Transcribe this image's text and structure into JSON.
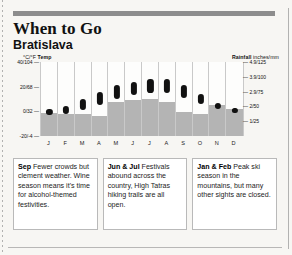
{
  "header": {
    "title": "When to Go",
    "subtitle": "Bratislava"
  },
  "chart_legend": {
    "temp_label": "°C/°F",
    "temp_word": "Temp",
    "rain_word": "Rainfall",
    "rain_label": "inches/mm"
  },
  "chart_data": {
    "type": "bar",
    "subtitle": "Bratislava",
    "categories": [
      "J",
      "F",
      "M",
      "A",
      "M",
      "J",
      "J",
      "A",
      "S",
      "O",
      "N",
      "D"
    ],
    "xlabel": "",
    "ylabel": "°C/°F Temp",
    "y2label": "Rainfall inches/mm",
    "ylim": [
      -20,
      40
    ],
    "y2lim": [
      0,
      125
    ],
    "grid": false,
    "legend_position": "top",
    "temp_ticks": [
      "40/104",
      "20/68",
      "0/32",
      "-20/-4"
    ],
    "temp_tick_values": [
      40,
      20,
      0,
      -20
    ],
    "rain_ticks": [
      "4.9/125",
      "3.9/100",
      "2.9/75",
      "2/50",
      "1/25"
    ],
    "rain_tick_values": [
      125,
      100,
      75,
      50,
      25
    ],
    "series": [
      {
        "name": "Temperature range (°C)",
        "type": "range-bar",
        "low": [
          -3,
          -2,
          1,
          5,
          10,
          13,
          15,
          15,
          11,
          6,
          2,
          -1
        ],
        "high": [
          2,
          4,
          10,
          16,
          21,
          24,
          26,
          26,
          21,
          14,
          7,
          3
        ]
      },
      {
        "name": "Rainfall (mm)",
        "type": "bar",
        "values": [
          39,
          38,
          38,
          34,
          58,
          60,
          62,
          57,
          41,
          37,
          52,
          45
        ]
      }
    ]
  },
  "callouts": [
    {
      "id": "callout-sep",
      "lead": "Sep",
      "text": " Fewer crowds but clement weather. Wine season means it's time for alcohol-themed festivities."
    },
    {
      "id": "callout-jun-jul",
      "lead": "Jun & Jul",
      "text": " Festivals abound across the country, High Tatras hiking trails are all open."
    },
    {
      "id": "callout-jan-feb",
      "lead": "Jan & Feb",
      "text": " Peak ski season in the mountains, but many other sights are closed."
    }
  ]
}
